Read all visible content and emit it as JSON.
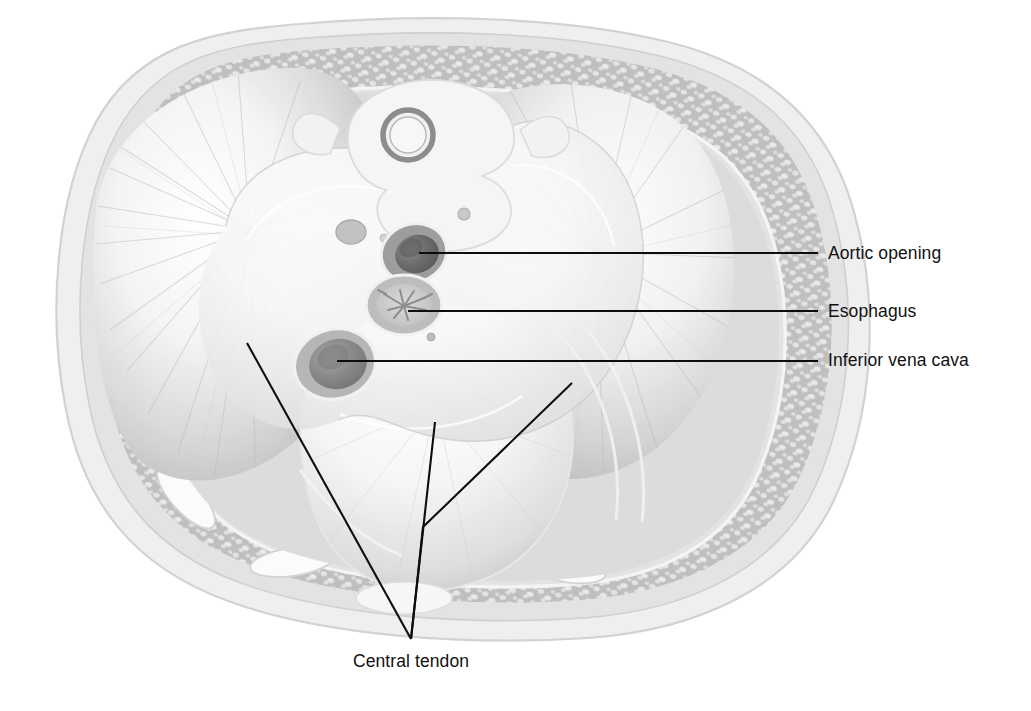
{
  "figure": {
    "style": "grayscale-medical-illustration",
    "canvas": {
      "width": 1031,
      "height": 711
    },
    "background_color": "#ffffff"
  },
  "palette": {
    "background": "#ffffff",
    "skin_outline": "#d8d8d8",
    "skin_fill": "#ededed",
    "muscle_wall": "#c0c0c0",
    "muscle_wall_dark": "#a8a8a8",
    "rib_fill": "#fbfbfb",
    "rib_outline": "#d4d4d4",
    "diaphragm_muscle": "#cfcfcf",
    "diaphragm_muscle_dark": "#b4b4b4",
    "central_tendon": "#fafafa",
    "pericardium": "#e6e6e6",
    "vertebra_fill": "#f4f4f4",
    "spinal_canal": "#8e8e8e",
    "aorta_lumen": "#6f6f6f",
    "aorta_wall": "#9a9a9a",
    "esophagus_wall": "#b5b5b5",
    "esophagus_mucosa": "#cdcdcd",
    "ivc_lumen": "#8a8a8a",
    "ivc_wall": "#b0b0b0",
    "leader_line": "#0d0d0d",
    "label_text": "#111111"
  },
  "labels": [
    {
      "id": "aortic-opening",
      "text": "Aortic opening",
      "text_x": 828,
      "text_y": 259,
      "anchor": "start",
      "leader": {
        "type": "straight",
        "points": [
          [
            419,
            253
          ],
          [
            818,
            253
          ]
        ]
      },
      "target_structure": "aortic-opening"
    },
    {
      "id": "esophagus",
      "text": "Esophagus",
      "text_x": 828,
      "text_y": 317,
      "anchor": "start",
      "leader": {
        "type": "straight",
        "points": [
          [
            408,
            311
          ],
          [
            818,
            311
          ]
        ]
      },
      "target_structure": "esophageal-hiatus"
    },
    {
      "id": "inferior-vena-cava",
      "text": "Inferior vena cava",
      "text_x": 828,
      "text_y": 366,
      "anchor": "start",
      "leader": {
        "type": "straight",
        "points": [
          [
            337,
            361
          ],
          [
            818,
            361
          ]
        ]
      },
      "target_structure": "caval-opening"
    },
    {
      "id": "central-tendon",
      "text": "Central tendon",
      "text_x": 411,
      "text_y": 667,
      "anchor": "middle",
      "leader": {
        "type": "converging",
        "junction": [
          411,
          639
        ],
        "branches": [
          [
            [
              247,
              343
            ],
            [
              411,
              639
            ]
          ],
          [
            [
              435,
              422
            ],
            [
              411,
              639
            ]
          ],
          [
            [
              572,
              383
            ],
            [
              423,
              527
            ],
            [
              411,
              639
            ]
          ]
        ]
      },
      "target_structure": "central-tendon"
    }
  ],
  "structures": [
    {
      "id": "body-wall",
      "name": "Thoracic body wall",
      "visible_label": false
    },
    {
      "id": "ribs",
      "name": "Ribs",
      "visible_label": false
    },
    {
      "id": "vertebra",
      "name": "Thoracic vertebra",
      "visible_label": false
    },
    {
      "id": "spinal-canal",
      "name": "Vertebral canal",
      "visible_label": false
    },
    {
      "id": "sternum",
      "name": "Sternum / xiphoid region",
      "visible_label": false
    },
    {
      "id": "central-tendon",
      "name": "Central tendon of diaphragm",
      "visible_label": true
    },
    {
      "id": "diaphragm-muscle",
      "name": "Muscular part of diaphragm",
      "visible_label": false
    },
    {
      "id": "aortic-opening",
      "name": "Aortic opening (aortic hiatus)",
      "visible_label": true
    },
    {
      "id": "esophageal-hiatus",
      "name": "Esophageal hiatus",
      "visible_label": true
    },
    {
      "id": "caval-opening",
      "name": "Caval opening (inferior vena cava)",
      "visible_label": true
    }
  ]
}
